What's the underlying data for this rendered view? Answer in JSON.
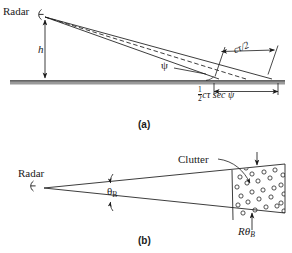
{
  "figure": {
    "width": 292,
    "height": 253,
    "background": "#ffffff",
    "ink_color": "#1a1a1a",
    "ground_color": "#9a9a9a"
  },
  "panel_a": {
    "caption": "(a)",
    "radar_label": "Radar",
    "radar_icon": "antenna-icon",
    "height_label": "h",
    "grazing_angle_label": "ψ",
    "range_resolution_label": "cτ/2",
    "ground_patch_label_parts": {
      "fraction_numerator": "1",
      "fraction_denominator": "2",
      "rest": "cτ sec ψ"
    },
    "ground_patch_label": "½cτ sec ψ",
    "beam_center_line_style": "dashed",
    "beam_edge_line_style": "solid",
    "ground_line_style": "thick-gray-band"
  },
  "panel_b": {
    "caption": "(b)",
    "radar_label": "Radar",
    "radar_icon": "antenna-icon",
    "beamwidth_label": "θB",
    "beamwidth_label_parts": {
      "base": "θ",
      "sub": "B"
    },
    "clutter_label": "Clutter",
    "cross_range_label": "RθB",
    "cross_range_label_parts": {
      "base": "Rθ",
      "sub": "B"
    },
    "clutter_fill": "scattered-open-circles",
    "clutter_circle_count": 26
  }
}
